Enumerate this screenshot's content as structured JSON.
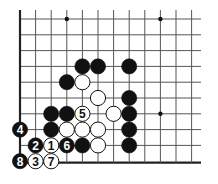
{
  "diagram": {
    "type": "go-board-corner",
    "grid": {
      "columns": 12,
      "rows": 10,
      "origin_x": 20,
      "origin_y": 19,
      "spacing_x": 15.6,
      "spacing_y": 15.8,
      "line_extent_right": 201,
      "line_extent_top": 10,
      "edges": [
        "left",
        "bottom"
      ],
      "line_color": "#555555",
      "edge_color": "#222222"
    },
    "hoshi": [
      {
        "col": 3,
        "row": 0
      },
      {
        "col": 9,
        "row": 0
      },
      {
        "col": 9,
        "row": 6
      }
    ],
    "stones": [
      {
        "color": "black",
        "col": 4,
        "row": 3,
        "label": ""
      },
      {
        "color": "black",
        "col": 5,
        "row": 3,
        "label": ""
      },
      {
        "color": "black",
        "col": 7,
        "row": 3,
        "label": ""
      },
      {
        "color": "black",
        "col": 3,
        "row": 4,
        "label": ""
      },
      {
        "color": "white",
        "col": 4,
        "row": 4,
        "label": ""
      },
      {
        "color": "white",
        "col": 5,
        "row": 5,
        "label": ""
      },
      {
        "color": "black",
        "col": 7,
        "row": 5,
        "label": ""
      },
      {
        "color": "black",
        "col": 2,
        "row": 6,
        "label": ""
      },
      {
        "color": "black",
        "col": 3,
        "row": 6,
        "label": ""
      },
      {
        "color": "white",
        "col": 4,
        "row": 6,
        "label": "5"
      },
      {
        "color": "white",
        "col": 6,
        "row": 6,
        "label": ""
      },
      {
        "color": "black",
        "col": 7,
        "row": 6,
        "label": ""
      },
      {
        "color": "black",
        "col": 0,
        "row": 7,
        "label": "4"
      },
      {
        "color": "black",
        "col": 2,
        "row": 7,
        "label": ""
      },
      {
        "color": "white",
        "col": 3,
        "row": 7,
        "label": ""
      },
      {
        "color": "white",
        "col": 4,
        "row": 7,
        "label": ""
      },
      {
        "color": "white",
        "col": 5,
        "row": 7,
        "label": ""
      },
      {
        "color": "black",
        "col": 7,
        "row": 7,
        "label": ""
      },
      {
        "color": "black",
        "col": 1,
        "row": 8,
        "label": "2"
      },
      {
        "color": "white",
        "col": 2,
        "row": 8,
        "label": "1"
      },
      {
        "color": "black",
        "col": 3,
        "row": 8,
        "label": "6"
      },
      {
        "color": "black",
        "col": 4,
        "row": 8,
        "label": ""
      },
      {
        "color": "white",
        "col": 5,
        "row": 8,
        "label": ""
      },
      {
        "color": "black",
        "col": 7,
        "row": 8,
        "label": ""
      },
      {
        "color": "black",
        "col": 0,
        "row": 9,
        "label": "8"
      },
      {
        "color": "white",
        "col": 1,
        "row": 9,
        "label": "3"
      },
      {
        "color": "white",
        "col": 2,
        "row": 9,
        "label": "7"
      }
    ],
    "stone_radius": 7.6,
    "colors": {
      "black_stone": "#111111",
      "white_stone": "#ffffff",
      "stone_outline": "#111111",
      "background": "#ffffff"
    }
  }
}
